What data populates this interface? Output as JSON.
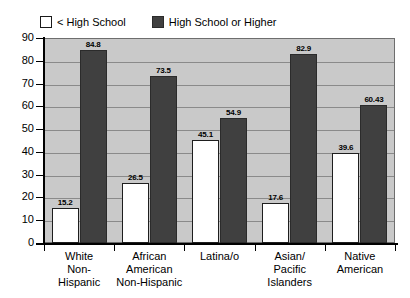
{
  "chart_data": {
    "type": "bar",
    "title": "",
    "xlabel": "",
    "ylabel": "",
    "ylim": [
      0,
      90
    ],
    "ytick_step": 10,
    "yticks": [
      90,
      80,
      70,
      60,
      50,
      40,
      30,
      20,
      10,
      0
    ],
    "grid": true,
    "legend_position": "top-left",
    "categories": [
      "White\nNon-\nHispanic",
      "African\nAmerican\nNon-Hispanic",
      "Latina/o",
      "Asian/\nPacific\nIslanders",
      "Native\nAmerican"
    ],
    "series": [
      {
        "name": "< High School",
        "color": "#ffffff",
        "values": [
          15.2,
          26.5,
          45.1,
          17.6,
          39.6
        ],
        "labels": [
          "15.2",
          "26.5",
          "45.1",
          "17.6",
          "39.6"
        ]
      },
      {
        "name": "High School or Higher",
        "color": "#404040",
        "values": [
          84.8,
          73.5,
          54.9,
          82.9,
          60.43
        ],
        "labels": [
          "84.8",
          "73.5",
          "54.9",
          "82.9",
          "60.43"
        ]
      }
    ]
  },
  "legend": {
    "entries": [
      {
        "label": "< High School",
        "swatch": "light-square-icon"
      },
      {
        "label": "High School or Higher",
        "swatch": "dark-square-icon"
      }
    ]
  },
  "colors": {
    "plot_background": "#c9c9c9",
    "gridline": "#8a8a8a",
    "axis": "#000000",
    "series_light": "#ffffff",
    "series_dark": "#404040"
  }
}
